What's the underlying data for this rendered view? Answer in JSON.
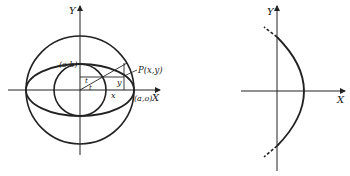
{
  "figure_left": {
    "description": "Ellipse x=a cos t, y=b sin t constructed from two concentric circles",
    "axis_x_label": "X",
    "axis_y_label": "Y",
    "point_b_label": "(o,b)",
    "point_a_label": "(a,o)",
    "point_p_label": "P(x,y)",
    "x_label": "x",
    "y_label": "y",
    "angle_label_1": "t",
    "angle_label_2": "t"
  },
  "figure_right": {
    "description": "Parabola-like curve opening left with dashed extensions",
    "axis_x_label": "X",
    "axis_y_label": "Y"
  },
  "colors": {
    "stroke": "#222222",
    "background": "#ffffff"
  }
}
